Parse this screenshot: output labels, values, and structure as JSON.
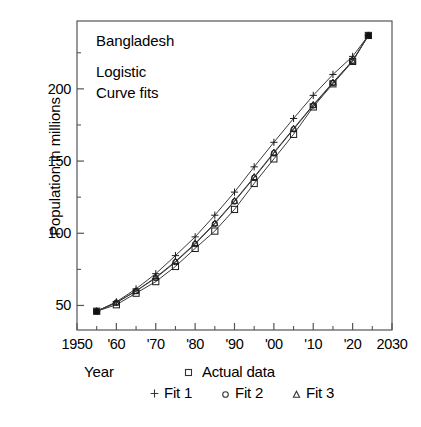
{
  "chart_data": {
    "type": "line",
    "title": "Bangladesh",
    "subtitle_line1": "Logistic",
    "subtitle_line2": "Curve fits",
    "xlabel": "Year",
    "ylabel": "Population in millions",
    "xlim": [
      1950,
      2030
    ],
    "ylim": [
      33,
      247
    ],
    "grid": false,
    "legend_position": "below-axis",
    "xtick_labels": [
      "1950",
      "'60",
      "'70",
      "'80",
      "'90",
      "'00",
      "'10",
      "'20",
      "2030"
    ],
    "xtick_values": [
      1950,
      1960,
      1970,
      1980,
      1990,
      2000,
      2010,
      2020,
      2030
    ],
    "ytick_labels": [
      "50",
      "100",
      "150",
      "200"
    ],
    "ytick_values": [
      50,
      100,
      150,
      200
    ],
    "yminor_values": [
      25,
      75,
      125,
      175,
      225
    ],
    "x": [
      1955,
      1960,
      1965,
      1970,
      1975,
      1980,
      1985,
      1990,
      1995,
      2000,
      2005,
      2010,
      2015,
      2020,
      2024
    ],
    "series": [
      {
        "name": "Actual data",
        "marker": "square",
        "values": [
          46,
          50.5,
          58.5,
          66.5,
          77,
          89.5,
          101.5,
          116.5,
          134.5,
          151.5,
          168.5,
          187.5,
          203.5,
          219,
          237
        ]
      },
      {
        "name": "Fit 1",
        "marker": "plus",
        "values": [
          46,
          52.5,
          61.5,
          72,
          84.5,
          97.5,
          112.5,
          128.5,
          146,
          163,
          179.5,
          195.5,
          210,
          222.5,
          237
        ]
      },
      {
        "name": "Fit 2",
        "marker": "circle",
        "values": [
          46,
          52,
          60,
          69,
          80,
          92.5,
          106.5,
          122,
          138.5,
          155.5,
          172,
          188.5,
          204,
          219.5,
          237
        ]
      },
      {
        "name": "Fit 3",
        "marker": "triangle",
        "values": [
          46,
          52,
          60,
          69.5,
          80.5,
          93,
          107,
          122.5,
          139,
          156,
          172.5,
          189,
          204.5,
          219.5,
          237
        ]
      }
    ]
  },
  "legend": {
    "actual": "Actual data",
    "fit1": "Fit 1",
    "fit2": "Fit 2",
    "fit3": "Fit 3"
  }
}
